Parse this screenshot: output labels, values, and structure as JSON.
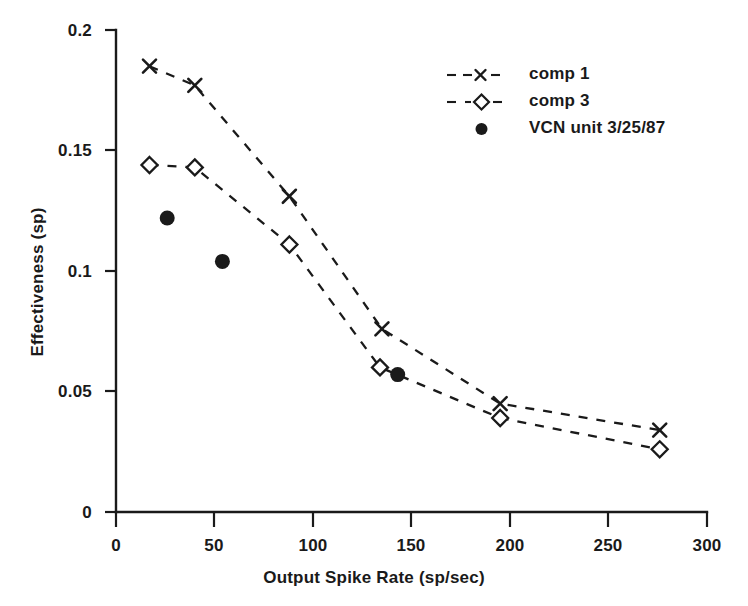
{
  "chart_data": {
    "type": "scatter",
    "title": "",
    "xlabel": "Output Spike Rate (sp/sec)",
    "ylabel": "Effectiveness (sp)",
    "xlim": [
      0,
      300
    ],
    "ylim": [
      0,
      0.2
    ],
    "xticks": [
      0,
      50,
      100,
      150,
      200,
      250,
      300
    ],
    "xtick_labels": [
      "0",
      "50",
      "100",
      "150",
      "200",
      "250",
      "300"
    ],
    "yticks": [
      0,
      0.05,
      0.1,
      0.15,
      0.2
    ],
    "ytick_labels": [
      "0",
      "0.05",
      "0.1",
      "0.15",
      "0.2"
    ],
    "grid": false,
    "legend_position": "upper right",
    "series": [
      {
        "name": "comp 1",
        "marker": "x",
        "linestyle": "dashed",
        "color": "#1a1a1a",
        "x": [
          17,
          40,
          88,
          135,
          195,
          276
        ],
        "y": [
          0.185,
          0.177,
          0.131,
          0.076,
          0.045,
          0.034
        ]
      },
      {
        "name": "comp 3",
        "marker": "diamond-open",
        "linestyle": "dashed",
        "color": "#1a1a1a",
        "x": [
          17,
          40,
          88,
          134,
          195,
          276
        ],
        "y": [
          0.144,
          0.143,
          0.111,
          0.06,
          0.039,
          0.026
        ]
      },
      {
        "name": "VCN unit 3/25/87",
        "marker": "circle-filled",
        "linestyle": "none",
        "color": "#1a1a1a",
        "x": [
          26,
          54,
          143
        ],
        "y": [
          0.122,
          0.104,
          0.057
        ]
      }
    ]
  },
  "legend": {
    "items": [
      {
        "label": "comp 1",
        "marker": "x-marker-icon"
      },
      {
        "label": "comp 3",
        "marker": "diamond-marker-icon"
      },
      {
        "label": "VCN unit 3/25/87",
        "marker": "filled-circle-marker-icon"
      }
    ]
  }
}
